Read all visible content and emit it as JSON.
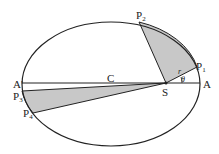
{
  "diagram": {
    "colors": {
      "stroke": "#222222",
      "fill": "#c8c8c8",
      "background": "#ffffff"
    },
    "labels": {
      "A_prime": "A'",
      "A": "A",
      "C": "C",
      "S": "S",
      "P1": "P",
      "P1_sub": "1",
      "P2": "P",
      "P2_sub": "2",
      "P3": "P",
      "P3_sub": "3",
      "P4": "P",
      "P4_sub": "4",
      "r": "r",
      "theta": "θ"
    }
  }
}
